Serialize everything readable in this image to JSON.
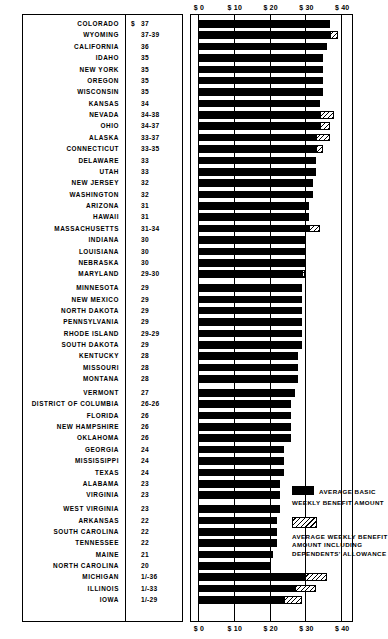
{
  "chart_data": {
    "type": "bar",
    "orientation": "horizontal",
    "title": "",
    "xlabel": "",
    "ylabel": "",
    "xlim": [
      0,
      45
    ],
    "grid": true,
    "axis_tick_labels": [
      "$ 0",
      "$ 10",
      "$ 20",
      "$ 30",
      "$ 40"
    ],
    "axis_tick_values": [
      0,
      10,
      20,
      30,
      40
    ],
    "currency_symbol": "$",
    "legend": {
      "position": "bottom-right",
      "entries": [
        {
          "swatch": "solid-black",
          "lines": [
            "AVERAGE BASIC",
            "WEEKLY BENEFIT AMOUNT"
          ]
        },
        {
          "swatch": "diagonal-hatch",
          "lines": [
            "AVERAGE WEEKLY BENEFIT",
            "AMOUNT INCLUDING",
            "DEPENDENTS' ALLOWANCE"
          ]
        }
      ]
    },
    "series": [
      {
        "name": "AVERAGE BASIC WEEKLY BENEFIT AMOUNT",
        "key": "basic"
      },
      {
        "name": "AVERAGE WEEKLY BENEFIT AMOUNT INCLUDING DEPENDENTS' ALLOWANCE",
        "key": "with_dependents"
      }
    ],
    "categories": [
      "COLORADO",
      "WYOMING",
      "CALIFORNIA",
      "IDAHO",
      "NEW YORK",
      "OREGON",
      "WISCONSIN",
      "KANSAS",
      "NEVADA",
      "OHIO",
      "ALASKA",
      "CONNECTICUT",
      "DELAWARE",
      "UTAH",
      "NEW JERSEY",
      "WASHINGTON",
      "ARIZONA",
      "HAWAII",
      "MASSACHUSETTS",
      "INDIANA",
      "LOUISIANA",
      "NEBRASKA",
      "MARYLAND",
      "MINNESOTA",
      "NEW MEXICO",
      "NORTH DAKOTA",
      "PENNSYLVANIA",
      "RHODE ISLAND",
      "SOUTH DAKOTA",
      "KENTUCKY",
      "MISSOURI",
      "MONTANA",
      "VERMONT",
      "DISTRICT OF COLUMBIA",
      "FLORIDA",
      "NEW HAMPSHIRE",
      "OKLAHOMA",
      "GEORGIA",
      "MISSISSIPPI",
      "TEXAS",
      "ALABAMA",
      "VIRGINIA",
      "WEST VIRGINIA",
      "ARKANSAS",
      "SOUTH CAROLINA",
      "TENNESSEE",
      "MAINE",
      "NORTH CAROLINA",
      "MICHIGAN",
      "ILLINOIS",
      "IOWA"
    ],
    "rows": [
      {
        "state": "COLORADO",
        "label": "37",
        "basic": 37,
        "with_dependents": null,
        "gap_before": false,
        "show_dollar": true
      },
      {
        "state": "WYOMING",
        "label": "37-39",
        "basic": 37,
        "with_dependents": 39,
        "gap_before": false,
        "show_dollar": false
      },
      {
        "state": "CALIFORNIA",
        "label": "36",
        "basic": 36,
        "with_dependents": null,
        "gap_before": false,
        "show_dollar": false
      },
      {
        "state": "IDAHO",
        "label": "35",
        "basic": 35,
        "with_dependents": null,
        "gap_before": false,
        "show_dollar": false
      },
      {
        "state": "NEW YORK",
        "label": "35",
        "basic": 35,
        "with_dependents": null,
        "gap_before": false,
        "show_dollar": false
      },
      {
        "state": "OREGON",
        "label": "35",
        "basic": 35,
        "with_dependents": null,
        "gap_before": false,
        "show_dollar": false
      },
      {
        "state": "WISCONSIN",
        "label": "35",
        "basic": 35,
        "with_dependents": null,
        "gap_before": false,
        "show_dollar": false
      },
      {
        "state": "KANSAS",
        "label": "34",
        "basic": 34,
        "with_dependents": null,
        "gap_before": false,
        "show_dollar": false
      },
      {
        "state": "NEVADA",
        "label": "34-38",
        "basic": 34,
        "with_dependents": 38,
        "gap_before": false,
        "show_dollar": false
      },
      {
        "state": "OHIO",
        "label": "34-37",
        "basic": 34,
        "with_dependents": 37,
        "gap_before": false,
        "show_dollar": false
      },
      {
        "state": "ALASKA",
        "label": "33-37",
        "basic": 33,
        "with_dependents": 37,
        "gap_before": false,
        "show_dollar": false
      },
      {
        "state": "CONNECTICUT",
        "label": "33-35",
        "basic": 33,
        "with_dependents": 35,
        "gap_before": false,
        "show_dollar": false
      },
      {
        "state": "DELAWARE",
        "label": "33",
        "basic": 33,
        "with_dependents": null,
        "gap_before": false,
        "show_dollar": false
      },
      {
        "state": "UTAH",
        "label": "33",
        "basic": 33,
        "with_dependents": null,
        "gap_before": false,
        "show_dollar": false
      },
      {
        "state": "NEW JERSEY",
        "label": "32",
        "basic": 32,
        "with_dependents": null,
        "gap_before": false,
        "show_dollar": false
      },
      {
        "state": "WASHINGTON",
        "label": "32",
        "basic": 32,
        "with_dependents": null,
        "gap_before": false,
        "show_dollar": false
      },
      {
        "state": "ARIZONA",
        "label": "31",
        "basic": 31,
        "with_dependents": null,
        "gap_before": false,
        "show_dollar": false
      },
      {
        "state": "HAWAII",
        "label": "31",
        "basic": 31,
        "with_dependents": null,
        "gap_before": false,
        "show_dollar": false
      },
      {
        "state": "MASSACHUSETTS",
        "label": "31-34",
        "basic": 31,
        "with_dependents": 34,
        "gap_before": false,
        "show_dollar": false
      },
      {
        "state": "INDIANA",
        "label": "30",
        "basic": 30,
        "with_dependents": null,
        "gap_before": false,
        "show_dollar": false
      },
      {
        "state": "LOUISIANA",
        "label": "30",
        "basic": 30,
        "with_dependents": null,
        "gap_before": false,
        "show_dollar": false
      },
      {
        "state": "NEBRASKA",
        "label": "30",
        "basic": 30,
        "with_dependents": null,
        "gap_before": false,
        "show_dollar": false
      },
      {
        "state": "MARYLAND",
        "label": "29-30",
        "basic": 29,
        "with_dependents": 30,
        "gap_before": false,
        "show_dollar": false
      },
      {
        "state": "MINNESOTA",
        "label": "29",
        "basic": 29,
        "with_dependents": null,
        "gap_before": true,
        "show_dollar": false
      },
      {
        "state": "NEW MEXICO",
        "label": "29",
        "basic": 29,
        "with_dependents": null,
        "gap_before": false,
        "show_dollar": false
      },
      {
        "state": "NORTH DAKOTA",
        "label": "29",
        "basic": 29,
        "with_dependents": null,
        "gap_before": false,
        "show_dollar": false
      },
      {
        "state": "PENNSYLVANIA",
        "label": "29",
        "basic": 29,
        "with_dependents": null,
        "gap_before": false,
        "show_dollar": false
      },
      {
        "state": "RHODE ISLAND",
        "label": "29-29",
        "basic": 29,
        "with_dependents": null,
        "gap_before": false,
        "show_dollar": false
      },
      {
        "state": "SOUTH DAKOTA",
        "label": "29",
        "basic": 29,
        "with_dependents": null,
        "gap_before": false,
        "show_dollar": false
      },
      {
        "state": "KENTUCKY",
        "label": "28",
        "basic": 28,
        "with_dependents": null,
        "gap_before": false,
        "show_dollar": false
      },
      {
        "state": "MISSOURI",
        "label": "28",
        "basic": 28,
        "with_dependents": null,
        "gap_before": false,
        "show_dollar": false
      },
      {
        "state": "MONTANA",
        "label": "28",
        "basic": 28,
        "with_dependents": null,
        "gap_before": false,
        "show_dollar": false
      },
      {
        "state": "VERMONT",
        "label": "27",
        "basic": 27,
        "with_dependents": null,
        "gap_before": true,
        "show_dollar": false
      },
      {
        "state": "DISTRICT OF COLUMBIA",
        "label": "26-26",
        "basic": 26,
        "with_dependents": null,
        "gap_before": false,
        "show_dollar": false
      },
      {
        "state": "FLORIDA",
        "label": "26",
        "basic": 26,
        "with_dependents": null,
        "gap_before": false,
        "show_dollar": false
      },
      {
        "state": "NEW HAMPSHIRE",
        "label": "26",
        "basic": 26,
        "with_dependents": null,
        "gap_before": false,
        "show_dollar": false
      },
      {
        "state": "OKLAHOMA",
        "label": "26",
        "basic": 26,
        "with_dependents": null,
        "gap_before": false,
        "show_dollar": false
      },
      {
        "state": "GEORGIA",
        "label": "24",
        "basic": 24,
        "with_dependents": null,
        "gap_before": false,
        "show_dollar": false
      },
      {
        "state": "MISSISSIPPI",
        "label": "24",
        "basic": 24,
        "with_dependents": null,
        "gap_before": false,
        "show_dollar": false
      },
      {
        "state": "TEXAS",
        "label": "24",
        "basic": 24,
        "with_dependents": null,
        "gap_before": false,
        "show_dollar": false
      },
      {
        "state": "ALABAMA",
        "label": "23",
        "basic": 23,
        "with_dependents": null,
        "gap_before": false,
        "show_dollar": false
      },
      {
        "state": "VIRGINIA",
        "label": "23",
        "basic": 23,
        "with_dependents": null,
        "gap_before": false,
        "show_dollar": false
      },
      {
        "state": "WEST VIRGINIA",
        "label": "23",
        "basic": 23,
        "with_dependents": null,
        "gap_before": true,
        "show_dollar": false
      },
      {
        "state": "ARKANSAS",
        "label": "22",
        "basic": 22,
        "with_dependents": null,
        "gap_before": false,
        "show_dollar": false
      },
      {
        "state": "SOUTH CAROLINA",
        "label": "22",
        "basic": 22,
        "with_dependents": null,
        "gap_before": false,
        "show_dollar": false
      },
      {
        "state": "TENNESSEE",
        "label": "22",
        "basic": 22,
        "with_dependents": null,
        "gap_before": false,
        "show_dollar": false
      },
      {
        "state": "MAINE",
        "label": "21",
        "basic": 21,
        "with_dependents": null,
        "gap_before": false,
        "show_dollar": false
      },
      {
        "state": "NORTH CAROLINA",
        "label": "20",
        "basic": 20,
        "with_dependents": null,
        "gap_before": false,
        "show_dollar": false
      },
      {
        "state": "MICHIGAN",
        "label": "1/-36",
        "basic": 30,
        "with_dependents": 36,
        "gap_before": false,
        "show_dollar": false
      },
      {
        "state": "ILLINOIS",
        "label": "1/-33",
        "basic": 27,
        "with_dependents": 33,
        "gap_before": false,
        "show_dollar": false
      },
      {
        "state": "IOWA",
        "label": "1/-29",
        "basic": 24,
        "with_dependents": 29,
        "gap_before": false,
        "show_dollar": false
      }
    ]
  }
}
